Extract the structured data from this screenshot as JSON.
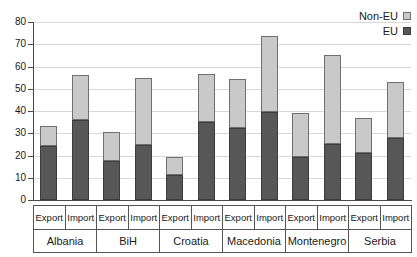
{
  "chart_data": {
    "type": "bar",
    "subtype": "stacked-bar-grouped",
    "title": "",
    "subtitle": "",
    "xlabel": "",
    "ylabel": "",
    "ylim": [
      0,
      80
    ],
    "yticks": [
      0,
      10,
      20,
      30,
      40,
      50,
      60,
      70,
      80
    ],
    "ytick_labels": [
      "0",
      "10",
      "20",
      "30",
      "40",
      "50",
      "60",
      "70",
      "80"
    ],
    "grid": true,
    "grid_axis": "y",
    "legend_position": "top-right",
    "legend": [
      "Non-EU",
      "EU"
    ],
    "stack_order_bottom_to_top": [
      "EU",
      "Non-EU"
    ],
    "colors": {
      "EU": "#575757",
      "Non-EU": "#c9c9c9",
      "grid": "#d8d8d8",
      "axis": "#4a4a4a",
      "text": "#1a1a1a",
      "background": "#ffffff"
    },
    "groups": [
      "Albania",
      "BiH",
      "Croatia",
      "Macedonia",
      "Montenegro",
      "Serbia"
    ],
    "flows": [
      "Export",
      "Import"
    ],
    "categories": [
      "Albania Export",
      "Albania Import",
      "BiH Export",
      "BiH Import",
      "Croatia Export",
      "Croatia Import",
      "Macedonia Export",
      "Macedonia Import",
      "Montenegro Export",
      "Montenegro Import",
      "Serbia Export",
      "Serbia Import"
    ],
    "series": [
      {
        "name": "EU",
        "values": [
          24.2,
          35.8,
          17.4,
          24.5,
          11.1,
          35.1,
          32.2,
          39.7,
          19.5,
          25.1,
          21.0,
          27.8
        ]
      },
      {
        "name": "Non-EU",
        "values": [
          9.3,
          20.5,
          13.4,
          30.5,
          8.4,
          21.6,
          22.0,
          34.0,
          19.5,
          40.2,
          16.0,
          25.1
        ]
      }
    ],
    "totals": [
      33.5,
      56.3,
      30.8,
      55.0,
      19.5,
      56.7,
      54.2,
      73.7,
      39.0,
      65.3,
      37.0,
      52.9
    ]
  },
  "legend": {
    "items": [
      {
        "label": "Non-EU",
        "swatch": "legend-swatch-noneu"
      },
      {
        "label": "EU",
        "swatch": "legend-swatch-eu"
      }
    ]
  },
  "axis": {
    "y_labels": [
      "80",
      "70",
      "60",
      "50",
      "40",
      "30",
      "20",
      "10",
      "0"
    ]
  },
  "xaxis": {
    "groups": [
      {
        "country": "Albania",
        "flows": [
          "Export",
          "Import"
        ]
      },
      {
        "country": "BiH",
        "flows": [
          "Export",
          "Import"
        ]
      },
      {
        "country": "Croatia",
        "flows": [
          "Export",
          "Import"
        ]
      },
      {
        "country": "Macedonia",
        "flows": [
          "Export",
          "Import"
        ]
      },
      {
        "country": "Montenegro",
        "flows": [
          "Export",
          "Import"
        ]
      },
      {
        "country": "Serbia",
        "flows": [
          "Export",
          "Import"
        ]
      }
    ]
  }
}
